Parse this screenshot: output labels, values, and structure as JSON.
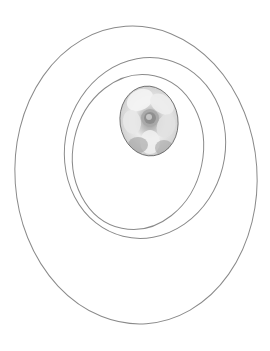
{
  "canvas": {
    "width": 270,
    "height": 351,
    "background": "#ffffff"
  },
  "colors": {
    "stroke": "#8a8a8a",
    "cameo_light": "#f2f2f2",
    "cameo_mid": "#c4c4c4",
    "cameo_dark": "#7e7e7e",
    "cameo_edge": "#5e5e5e"
  },
  "rings": [
    {
      "name": "outer",
      "cx": 136,
      "cy": 175,
      "rx": 121,
      "ry": 149,
      "rotate": -4
    },
    {
      "name": "middle",
      "cx": 145,
      "cy": 148,
      "rx": 80,
      "ry": 91,
      "rotate": 14
    },
    {
      "name": "inner",
      "cx": 138,
      "cy": 152,
      "rx": 65,
      "ry": 78,
      "rotate": 12
    }
  ],
  "cameo": {
    "subject": "flower",
    "cx": 149,
    "cy": 121,
    "rx": 29,
    "ry": 35,
    "rotate": -8
  }
}
